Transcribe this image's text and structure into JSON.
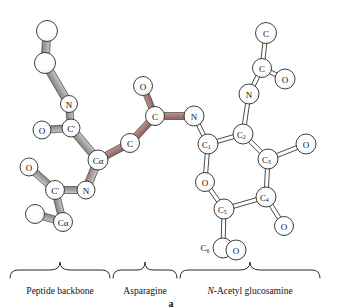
{
  "figure": {
    "panel_letter": "a",
    "width": 343,
    "height": 308,
    "background": "#ffffff"
  },
  "colors": {
    "backbone_bond": "#a9a6a4",
    "backbone_bond_dark": "#8d8a88",
    "asparagine_bond": "#a97b79",
    "asparagine_bond_dark": "#8c6260",
    "sugar_bond_fill": "#ffffff",
    "outline": "#2a2a2a",
    "atom_fill": "#ffffff",
    "text": "#111111"
  },
  "brackets": [
    {
      "id": "peptide-backbone",
      "label": "Peptide backbone",
      "label_plain": "Peptide backbone",
      "x1": 10,
      "x2": 110,
      "center_x": 60
    },
    {
      "id": "asparagine",
      "label": "Asparagine",
      "label_plain": "Asparagine",
      "x1": 112,
      "x2": 178,
      "center_x": 145
    },
    {
      "id": "n-acetyl-glucosamine",
      "label_italic_prefix": "N",
      "label_rest": "-Acetyl glucosamine",
      "label_plain": "N-Acetyl glucosamine",
      "x1": 180,
      "x2": 320,
      "center_x": 250
    }
  ],
  "atoms": {
    "peptide_backbone": [
      {
        "id": "pb-c-top",
        "label": "",
        "x": 47,
        "y": 31,
        "r": 10.5
      },
      {
        "id": "pb-c-upper",
        "label": "",
        "x": 45,
        "y": 63,
        "r": 10.5
      },
      {
        "id": "pb-n-upper",
        "label": "N",
        "x": 69,
        "y": 104,
        "r": 8.5
      },
      {
        "id": "pb-cprime-upper",
        "label": "C'",
        "x": 71,
        "y": 128,
        "r": 9
      },
      {
        "id": "pb-o-upper",
        "label": "O",
        "x": 42,
        "y": 130,
        "r": 9
      },
      {
        "id": "pb-calpha",
        "label": "Cα",
        "x": 98,
        "y": 160,
        "r": 10
      },
      {
        "id": "pb-n-lower",
        "label": "N",
        "x": 86,
        "y": 190,
        "r": 9
      },
      {
        "id": "pb-cprime-lower",
        "label": "C'",
        "x": 55,
        "y": 190,
        "r": 9.5
      },
      {
        "id": "pb-o-lower",
        "label": "O",
        "x": 29,
        "y": 167,
        "r": 9
      },
      {
        "id": "pb-calpha-lower",
        "label": "Cα",
        "x": 63,
        "y": 222,
        "r": 9.5
      },
      {
        "id": "pb-c-lower-extra",
        "label": "",
        "x": 35,
        "y": 214,
        "r": 9.5
      }
    ],
    "asparagine": [
      {
        "id": "asn-cbeta",
        "label": "C",
        "x": 130,
        "y": 143,
        "r": 9.5
      },
      {
        "id": "asn-cgamma",
        "label": "C",
        "x": 155,
        "y": 116,
        "r": 9.5
      },
      {
        "id": "asn-od1",
        "label": "O",
        "x": 143,
        "y": 86,
        "r": 9.5
      },
      {
        "id": "asn-nd2",
        "label": "N",
        "x": 194,
        "y": 116,
        "r": 10
      }
    ],
    "glucosamine_ring": [
      {
        "id": "glc-c1",
        "label": "C",
        "sub": "1",
        "x": 208,
        "y": 144,
        "r": 10
      },
      {
        "id": "glc-c2",
        "label": "C",
        "sub": "2",
        "x": 243,
        "y": 134,
        "r": 10
      },
      {
        "id": "glc-c3",
        "label": "C",
        "sub": "3",
        "x": 268,
        "y": 159,
        "r": 10
      },
      {
        "id": "glc-c4",
        "label": "C",
        "sub": "4",
        "x": 266,
        "y": 197,
        "r": 10
      },
      {
        "id": "glc-c5",
        "label": "C",
        "sub": "5",
        "x": 224,
        "y": 209,
        "r": 10
      },
      {
        "id": "glc-o-ring",
        "label": "O",
        "x": 205,
        "y": 182,
        "r": 9.5
      }
    ],
    "glucosamine_substituents": [
      {
        "id": "glc-o3",
        "label": "O",
        "x": 306,
        "y": 144,
        "r": 10
      },
      {
        "id": "glc-o4",
        "label": "O",
        "x": 284,
        "y": 226,
        "r": 9.5
      },
      {
        "id": "glc-c6-label",
        "label": "C",
        "sub": "6",
        "x": 205,
        "y": 248,
        "r": 0,
        "text_only": true
      },
      {
        "id": "glc-c6-atom",
        "label": "",
        "x": 223,
        "y": 248,
        "r": 10
      },
      {
        "id": "glc-o6",
        "label": "O",
        "x": 236,
        "y": 250,
        "r": 10
      }
    ],
    "n_acetyl": [
      {
        "id": "nac-n",
        "label": "N",
        "x": 249,
        "y": 94,
        "r": 10
      },
      {
        "id": "nac-c-carbonyl",
        "label": "C",
        "x": 262,
        "y": 68,
        "r": 9.5
      },
      {
        "id": "nac-o",
        "label": "O",
        "x": 285,
        "y": 79,
        "r": 10
      },
      {
        "id": "nac-ch3",
        "label": "C",
        "x": 266,
        "y": 33,
        "r": 10.5
      }
    ]
  },
  "bonds": {
    "backbone_gray": [
      {
        "from": "pb-c-top",
        "to": "pb-c-upper",
        "width": 8
      },
      {
        "from": "pb-c-upper",
        "to": "pb-n-upper",
        "width": 8
      },
      {
        "from": "pb-n-upper",
        "to": "pb-cprime-upper",
        "width": 7
      },
      {
        "from": "pb-cprime-upper",
        "to": "pb-o-upper",
        "width": 7
      },
      {
        "from": "pb-cprime-upper",
        "to": "pb-calpha",
        "width": 8
      },
      {
        "from": "pb-calpha",
        "to": "pb-n-lower",
        "width": 8
      },
      {
        "from": "pb-n-lower",
        "to": "pb-cprime-lower",
        "width": 7
      },
      {
        "from": "pb-cprime-lower",
        "to": "pb-o-lower",
        "width": 7
      },
      {
        "from": "pb-cprime-lower",
        "to": "pb-calpha-lower",
        "width": 7
      },
      {
        "from": "pb-calpha-lower",
        "to": "pb-c-lower-extra",
        "width": 7
      }
    ],
    "asparagine_rose": [
      {
        "from": "pb-calpha",
        "to": "asn-cbeta",
        "width": 7
      },
      {
        "from": "asn-cbeta",
        "to": "asn-cgamma",
        "width": 7
      },
      {
        "from": "asn-cgamma",
        "to": "asn-od1",
        "width": 6
      },
      {
        "from": "asn-cgamma",
        "to": "asn-nd2",
        "width": 7
      }
    ],
    "sugar_open": [
      {
        "from": "asn-nd2",
        "to": "glc-c1",
        "double": true
      },
      {
        "from": "glc-c1",
        "to": "glc-c2",
        "double": true
      },
      {
        "from": "glc-c2",
        "to": "glc-c3",
        "double": true
      },
      {
        "from": "glc-c3",
        "to": "glc-c4",
        "double": true
      },
      {
        "from": "glc-c4",
        "to": "glc-c5",
        "double": true
      },
      {
        "from": "glc-c5",
        "to": "glc-o-ring",
        "double": true
      },
      {
        "from": "glc-o-ring",
        "to": "glc-c1",
        "double": true
      },
      {
        "from": "glc-c3",
        "to": "glc-o3",
        "double": true
      },
      {
        "from": "glc-c4",
        "to": "glc-o4",
        "double": true
      },
      {
        "from": "glc-c5",
        "to": "glc-c6-atom",
        "double": true
      },
      {
        "from": "glc-c2",
        "to": "nac-n",
        "double": true
      },
      {
        "from": "nac-n",
        "to": "nac-c-carbonyl",
        "double": true
      },
      {
        "from": "nac-c-carbonyl",
        "to": "nac-o",
        "double": true
      },
      {
        "from": "nac-c-carbonyl",
        "to": "nac-ch3",
        "double": true
      }
    ]
  }
}
